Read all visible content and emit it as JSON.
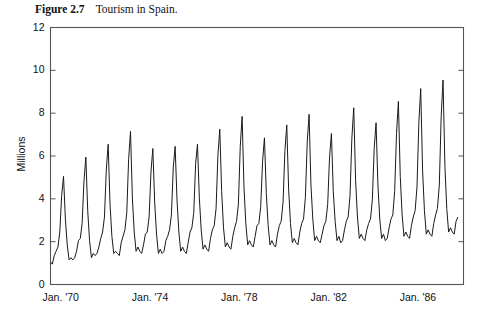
{
  "caption": {
    "number": "Figure 2.7",
    "text": "Tourism in Spain."
  },
  "chart_data": {
    "type": "line",
    "title": "Tourism in Spain.",
    "xlabel": "",
    "ylabel": "Millions",
    "ylim": [
      0,
      12
    ],
    "yticks": [
      0,
      2,
      4,
      6,
      8,
      10,
      12
    ],
    "ytick_labels": [
      "0",
      "2",
      "4",
      "6",
      "8",
      "10",
      "12"
    ],
    "grid": false,
    "legend": "none",
    "x_start_label": "Jan. '70",
    "xtick_labels": [
      "Jan. '70",
      "Jan. '74",
      "Jan. '78",
      "Jan. '82",
      "Jan. '86"
    ],
    "xtick_years": [
      1970,
      1974,
      1978,
      1982,
      1986
    ],
    "x_range_years": [
      1970,
      1988.5
    ],
    "line_color": "#1a1a1a",
    "frame_color": "#555555",
    "series": [
      {
        "name": "Tourists (millions, monthly)",
        "units": "millions",
        "frequency": "monthly",
        "start": "1970-01",
        "values": [
          1.05,
          0.95,
          1.35,
          1.55,
          1.75,
          2.45,
          4.15,
          5.05,
          3.05,
          1.85,
          1.15,
          1.25,
          1.15,
          1.25,
          1.55,
          2.05,
          2.15,
          2.85,
          4.85,
          5.95,
          3.45,
          2.05,
          1.25,
          1.45,
          1.35,
          1.45,
          1.75,
          2.15,
          2.45,
          3.15,
          5.35,
          6.55,
          3.75,
          2.25,
          1.45,
          1.55,
          1.45,
          1.35,
          1.95,
          2.25,
          2.55,
          3.35,
          5.85,
          7.15,
          4.05,
          2.45,
          1.55,
          1.75,
          1.55,
          1.45,
          1.85,
          2.35,
          2.45,
          3.15,
          5.25,
          6.35,
          3.85,
          2.35,
          1.45,
          1.65,
          1.45,
          1.55,
          2.05,
          2.25,
          2.55,
          3.25,
          5.45,
          6.45,
          3.95,
          2.45,
          1.55,
          1.75,
          1.55,
          1.45,
          1.95,
          2.45,
          2.65,
          3.35,
          5.65,
          6.55,
          4.05,
          2.55,
          1.65,
          1.85,
          1.65,
          1.55,
          2.15,
          2.55,
          2.75,
          3.55,
          6.05,
          7.25,
          4.35,
          2.65,
          1.75,
          1.95,
          1.75,
          1.65,
          2.25,
          2.65,
          2.95,
          3.75,
          6.45,
          7.85,
          4.55,
          2.85,
          1.85,
          2.05,
          1.85,
          1.75,
          2.25,
          2.75,
          2.85,
          3.65,
          5.75,
          6.85,
          4.25,
          2.75,
          1.85,
          2.05,
          1.85,
          1.75,
          2.35,
          2.75,
          2.95,
          3.85,
          6.25,
          7.45,
          4.45,
          2.85,
          1.95,
          2.15,
          1.95,
          1.85,
          2.45,
          2.85,
          3.05,
          4.05,
          6.65,
          7.95,
          4.65,
          3.05,
          2.05,
          2.25,
          2.05,
          1.95,
          2.35,
          2.75,
          2.95,
          3.75,
          5.95,
          7.05,
          4.35,
          2.95,
          2.05,
          2.25,
          1.95,
          2.05,
          2.55,
          2.95,
          3.15,
          4.15,
          6.85,
          8.25,
          4.85,
          3.15,
          2.15,
          2.35,
          2.15,
          2.05,
          2.55,
          2.85,
          3.05,
          3.95,
          6.35,
          7.55,
          4.65,
          3.05,
          2.15,
          2.35,
          2.05,
          2.15,
          2.65,
          3.05,
          3.25,
          4.35,
          7.05,
          8.55,
          5.05,
          3.25,
          2.25,
          2.45,
          2.25,
          2.15,
          2.75,
          3.15,
          3.45,
          4.55,
          7.55,
          9.15,
          5.35,
          3.45,
          2.35,
          2.55,
          2.35,
          2.25,
          2.85,
          3.25,
          3.55,
          4.65,
          7.85,
          9.55,
          5.55,
          3.55,
          2.45,
          2.65,
          2.45,
          2.35,
          2.95,
          3.15
        ]
      }
    ]
  }
}
